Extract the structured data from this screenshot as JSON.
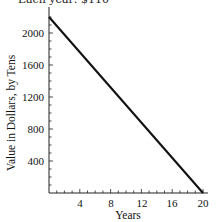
{
  "chart_data": {
    "type": "line",
    "title": "Each year: $110",
    "xlabel": "Years",
    "ylabel": "Value in Dollars, by Tens",
    "x": [
      0,
      20
    ],
    "series": [
      {
        "name": "Value",
        "values": [
          2200,
          0
        ]
      }
    ],
    "xticks": [
      4,
      8,
      12,
      16,
      20
    ],
    "yticks": [
      400,
      800,
      1200,
      1600,
      2000
    ],
    "xlim": [
      0,
      21
    ],
    "ylim": [
      0,
      2300
    ],
    "grid": false,
    "legend": null
  },
  "labels": {
    "caption": "Each year: $110",
    "xlabel": "Years",
    "ylabel": "Value in Dollars, by Tens",
    "xticks": [
      "4",
      "8",
      "12",
      "16",
      "20"
    ],
    "yticks": [
      "2000",
      "1600",
      "1200",
      "800",
      "400"
    ]
  },
  "colors": {
    "line": "#111111",
    "axis": "#222222"
  }
}
